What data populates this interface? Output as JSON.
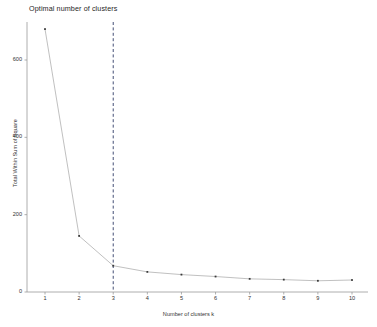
{
  "chart_data": {
    "type": "line",
    "title": "Optimal number of clusters",
    "xlabel": "Number of clusters k",
    "ylabel": "Total Within Sum of Square",
    "x": [
      1,
      2,
      3,
      4,
      5,
      6,
      7,
      8,
      9,
      10
    ],
    "values": [
      680,
      145,
      68,
      52,
      45,
      40,
      34,
      32,
      29,
      31
    ],
    "categories": [
      "1",
      "2",
      "3",
      "4",
      "5",
      "6",
      "7",
      "8",
      "9",
      "10"
    ],
    "xtick_labels": [
      "1",
      "2",
      "3",
      "4",
      "5",
      "6",
      "7",
      "8",
      "9",
      "10"
    ],
    "ytick_labels": [
      "0",
      "200",
      "400",
      "600"
    ],
    "ytick_values": [
      0,
      200,
      400,
      600
    ],
    "xlim": [
      0.6,
      10.6
    ],
    "ylim": [
      0,
      700
    ],
    "grid": false,
    "legend": null,
    "annotations": [
      {
        "name": "elbow-reference-line",
        "type": "vline",
        "x": 3,
        "style": "dashed",
        "color": "#2f3b66"
      }
    ],
    "series": [
      {
        "name": "total-within-sum-of-square",
        "values": [
          680,
          145,
          68,
          52,
          45,
          40,
          34,
          32,
          29,
          31
        ],
        "line_color": "#b9b9b9",
        "marker_color": "#3b3b3b",
        "marker": "dot"
      }
    ],
    "colors": {
      "line": "#b9b9b9",
      "marker": "#3b3b3b",
      "axis": "#9a9a9a",
      "vline": "#2f3b66",
      "background": "#ffffff",
      "text": "#333333"
    }
  }
}
